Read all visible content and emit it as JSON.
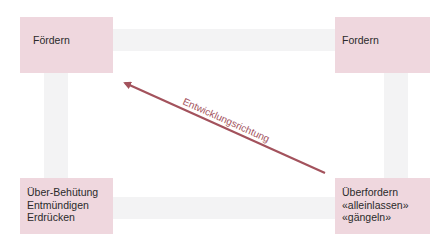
{
  "diagram": {
    "type": "quadrant-arrow-diagram",
    "colors": {
      "box_fill": "#efd7de",
      "frame_band": "#f3f3f4",
      "arrow": "#a3525c",
      "text": "#2a2a2a"
    },
    "boxes": {
      "top_left": {
        "lines": [
          "Fördern"
        ]
      },
      "top_right": {
        "lines": [
          "Fordern"
        ]
      },
      "bottom_left": {
        "lines": [
          "Über-Behütung",
          "Entmündigen",
          "Erdrücken"
        ]
      },
      "bottom_right": {
        "lines": [
          "Überfordern",
          "«alleinlassen»",
          "«gängeln»"
        ]
      }
    },
    "arrow": {
      "label": "Entwicklungsrichtung",
      "from": "bottom_right",
      "to": "top_left"
    }
  }
}
